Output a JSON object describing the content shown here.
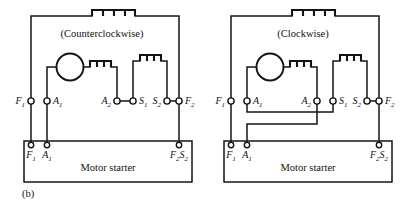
{
  "figure": {
    "caption": "(b)",
    "background_color": "#ffffff",
    "line_color": "#141414"
  },
  "diagrams": [
    {
      "id": "counterclockwise",
      "title": "(Counterclockwise)",
      "starter_label": "Motor starter",
      "armature_symbol": "circle",
      "top_coil": "shunt-field-coil",
      "terminals": [
        {
          "name": "F1",
          "letter": "F",
          "sub": "1",
          "side": "left"
        },
        {
          "name": "A1",
          "letter": "A",
          "sub": "1",
          "side": "right"
        },
        {
          "name": "A2",
          "letter": "A",
          "sub": "2",
          "side": "left"
        },
        {
          "name": "S1",
          "letter": "S",
          "sub": "1",
          "side": "right"
        },
        {
          "name": "S2",
          "letter": "S",
          "sub": "2",
          "side": "left"
        },
        {
          "name": "F2",
          "letter": "F",
          "sub": "2",
          "side": "right"
        }
      ],
      "starter_terminals": [
        {
          "name": "F1",
          "letter": "F",
          "sub": "1"
        },
        {
          "name": "A1",
          "letter": "A",
          "sub": "1"
        },
        {
          "name": "F2",
          "letter": "F",
          "sub": "2"
        },
        {
          "name": "S2",
          "letter": "S",
          "sub": "2"
        }
      ],
      "jumpers": [
        "A2-S1",
        "S2-F2"
      ]
    },
    {
      "id": "clockwise",
      "title": "(Clockwise)",
      "starter_label": "Motor starter",
      "armature_symbol": "circle",
      "top_coil": "shunt-field-coil",
      "terminals": [
        {
          "name": "F1",
          "letter": "F",
          "sub": "1",
          "side": "left"
        },
        {
          "name": "A1",
          "letter": "A",
          "sub": "1",
          "side": "right"
        },
        {
          "name": "A2",
          "letter": "A",
          "sub": "2",
          "side": "left"
        },
        {
          "name": "S1",
          "letter": "S",
          "sub": "1",
          "side": "right"
        },
        {
          "name": "S2",
          "letter": "S",
          "sub": "2",
          "side": "left"
        },
        {
          "name": "F2",
          "letter": "F",
          "sub": "2",
          "side": "right"
        }
      ],
      "starter_terminals": [
        {
          "name": "F1",
          "letter": "F",
          "sub": "1"
        },
        {
          "name": "A1",
          "letter": "A",
          "sub": "1"
        },
        {
          "name": "F2",
          "letter": "F",
          "sub": "2"
        },
        {
          "name": "S2",
          "letter": "S",
          "sub": "2"
        }
      ],
      "jumpers": [
        "A1-S1-crossover",
        "A2-A1starter-crossover",
        "S2-F2"
      ]
    }
  ]
}
